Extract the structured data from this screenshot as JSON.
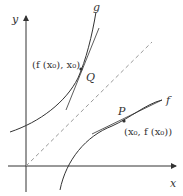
{
  "diagram": {
    "axes": {
      "x_label": "x",
      "y_label": "y"
    },
    "curves": [
      {
        "name": "g",
        "label": "g"
      },
      {
        "name": "f",
        "label": "f"
      }
    ],
    "points": {
      "Q": {
        "label": "Q",
        "coord_label": "(f (x₀), x₀)"
      },
      "P": {
        "label": "P",
        "coord_label": "(x₀, f (x₀))"
      }
    },
    "line_of_symmetry": "y = x (dashed)",
    "colors": {
      "stroke": "#333333",
      "dashed": "#999999",
      "background": "#ffffff"
    }
  }
}
